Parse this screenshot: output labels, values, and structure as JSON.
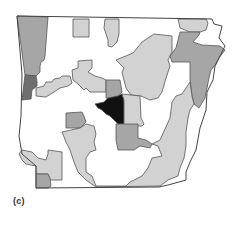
{
  "map": {
    "title": "Arkansas choropleth (panel c)",
    "panel_label": "(c)",
    "shading_levels": {
      "none": "#ffffff",
      "light": "#d2d2d2",
      "medium": "#a6a6a6",
      "dark": "#6e6e6e",
      "darkest": "#111111"
    },
    "regions": [
      {
        "id": "northwest-west-strip",
        "level": "medium"
      },
      {
        "id": "west-border-dark",
        "level": "dark"
      },
      {
        "id": "west-central-stepped",
        "level": "light"
      },
      {
        "id": "north-central-1",
        "level": "light"
      },
      {
        "id": "north-central-2",
        "level": "light"
      },
      {
        "id": "central-north-block",
        "level": "light"
      },
      {
        "id": "central-east-large",
        "level": "light"
      },
      {
        "id": "northeast-top",
        "level": "light"
      },
      {
        "id": "northeast-medium",
        "level": "medium"
      },
      {
        "id": "central-north-medium",
        "level": "medium"
      },
      {
        "id": "central-darkest",
        "level": "darkest"
      },
      {
        "id": "central-south-medium",
        "level": "medium"
      },
      {
        "id": "west-central-medium",
        "level": "medium"
      },
      {
        "id": "southwest-light",
        "level": "light"
      },
      {
        "id": "southwest-medium",
        "level": "medium"
      },
      {
        "id": "south-large-light",
        "level": "light"
      },
      {
        "id": "southeast-strip-light",
        "level": "light"
      }
    ]
  }
}
